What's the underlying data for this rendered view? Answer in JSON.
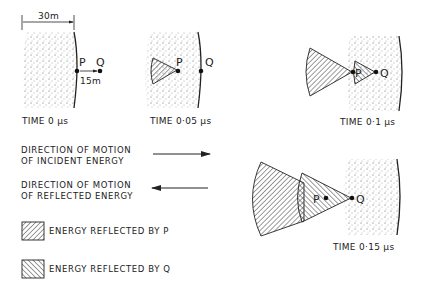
{
  "diagram": {
    "dimension_label": "30m",
    "spacing_label": "15m",
    "point_p": "P",
    "point_q": "Q",
    "panels": [
      {
        "time_label": "TIME 0 μs"
      },
      {
        "time_label": "TIME 0·05 μs"
      },
      {
        "time_label": "TIME 0·1 μs"
      },
      {
        "time_label": "TIME 0·15 μs"
      }
    ]
  },
  "legend": {
    "incident": {
      "line1": "DIRECTION OF MOTION",
      "line2": "OF INCIDENT ENERGY"
    },
    "reflected": {
      "line1": "DIRECTION OF MOTION",
      "line2": "OF REFLECTED ENERGY"
    },
    "energy_p": "ENERGY REFLECTED BY P",
    "energy_q": "ENERGY REFLECTED BY Q"
  }
}
